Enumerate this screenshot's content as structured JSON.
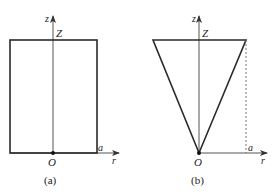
{
  "figure": {
    "panels": [
      {
        "id": "a",
        "caption": "(a)",
        "shape": "rectangle",
        "axis_vertical_label": "z",
        "axis_horizontal_label": "r",
        "height_label": "Z",
        "origin_label": "O",
        "radius_label": "a"
      },
      {
        "id": "b",
        "caption": "(b)",
        "shape": "inverted-triangle",
        "axis_vertical_label": "z",
        "axis_horizontal_label": "r",
        "height_label": "Z",
        "origin_label": "O",
        "radius_label": "a"
      }
    ]
  },
  "colors": {
    "line": "#2a2a2a",
    "axis": "#555555",
    "dashed": "#777777"
  }
}
